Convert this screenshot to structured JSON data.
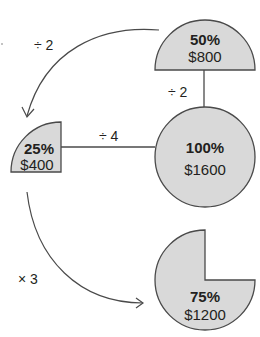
{
  "diagram": {
    "nodes": {
      "full": {
        "percent": "100%",
        "amount": "$1600"
      },
      "half": {
        "percent": "50%",
        "amount": "$800"
      },
      "quarter": {
        "percent": "25%",
        "amount": "$400"
      },
      "three_quarter": {
        "percent": "75%",
        "amount": "$1200"
      }
    },
    "operations": {
      "full_to_half": "÷ 2",
      "half_to_quarter": "÷ 2",
      "full_to_quarter": "÷ 4",
      "quarter_to_three_quarter": "× 3"
    },
    "colors": {
      "fill": "#d9d9d9",
      "stroke": "#4a4a4a",
      "text": "#231f20"
    }
  }
}
